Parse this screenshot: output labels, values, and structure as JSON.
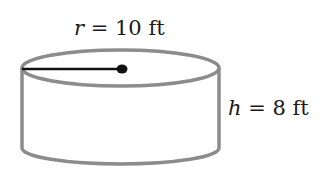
{
  "diagram": {
    "shape": "cylinder",
    "radius_label": {
      "variable": "r",
      "equals": " = ",
      "value": "10 ft"
    },
    "height_label": {
      "variable": "h",
      "equals": " = ",
      "value": "8 ft"
    },
    "colors": {
      "outline": "#8c8c8c",
      "radius_line": "#111111",
      "text": "#1a1a1a"
    }
  }
}
